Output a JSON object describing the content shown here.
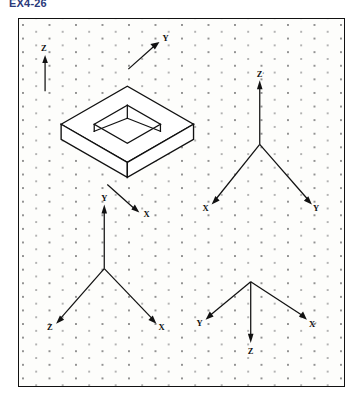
{
  "sheet": {
    "title": "EX4-26",
    "accent_color": "#2b3a7a",
    "line_color": "#111111",
    "frame_bg": "#fdfdfb",
    "grid_dot_color": "#8d8d8d"
  },
  "figure": {
    "type": "isometric-drawing-exercise",
    "grid": "isometric-dot-grid",
    "object": {
      "name": "rectangular-plate-with-square-hole",
      "description": "Isometric pictorial of a flat square plate with a square through-hole at its center",
      "axes": [
        {
          "label": "Z",
          "direction": "up"
        },
        {
          "label": "Y",
          "direction": "up-right"
        },
        {
          "label": "X",
          "direction": "down-right"
        }
      ]
    },
    "axis_systems": [
      {
        "name": "axes-top-right",
        "position": "top-right",
        "arms": [
          {
            "label": "Z",
            "prime": true,
            "direction": "up"
          },
          {
            "label": "X",
            "prime": false,
            "direction": "down-left"
          },
          {
            "label": "Y",
            "prime": false,
            "direction": "down-right"
          }
        ]
      },
      {
        "name": "axes-bottom-left",
        "position": "bottom-left",
        "arms": [
          {
            "label": "Y",
            "prime": false,
            "direction": "up"
          },
          {
            "label": "Z",
            "prime": false,
            "direction": "down-left"
          },
          {
            "label": "X",
            "prime": false,
            "direction": "down-right"
          }
        ]
      },
      {
        "name": "axes-bottom-right",
        "position": "bottom-right",
        "arms": [
          {
            "label": "Z",
            "prime": false,
            "direction": "down"
          },
          {
            "label": "Y",
            "prime": false,
            "direction": "up-left"
          },
          {
            "label": "X",
            "prime": true,
            "direction": "up-right"
          }
        ]
      }
    ]
  }
}
